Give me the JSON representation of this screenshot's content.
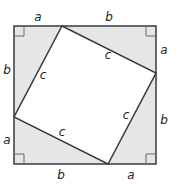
{
  "diagram": {
    "colors": {
      "background": "#ffffff",
      "triangle_fill": "#e6e6e6",
      "inner_square_fill": "#ffffff",
      "stroke": "#3a3a3a",
      "label": "#222222"
    },
    "outer_square": {
      "x": 14,
      "y": 26,
      "width": 142,
      "height": 138
    },
    "inner_square_vertices": [
      [
        62,
        26
      ],
      [
        156,
        73
      ],
      [
        108,
        164
      ],
      [
        14,
        117
      ]
    ],
    "labels": {
      "top_a": "a",
      "top_b": "b",
      "right_a": "a",
      "right_b": "b",
      "bottom_b": "b",
      "bottom_a": "a",
      "left_b": "b",
      "left_a": "a",
      "hyp_top": "c",
      "hyp_right": "c",
      "hyp_bottom": "c",
      "hyp_left": "c"
    },
    "right_angle_markers": 4
  }
}
